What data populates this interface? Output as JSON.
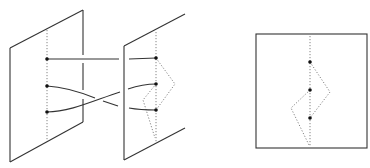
{
  "figure": {
    "colors": {
      "line": "#333333",
      "dotted": "#777777",
      "point": "#111111",
      "background": "#ffffff"
    },
    "left_panel": {
      "plane_left": {
        "outline": [
          [
            10,
            48
          ],
          [
            83,
            10
          ],
          [
            83,
            122
          ],
          [
            10,
            162
          ]
        ],
        "axis": {
          "x": 47,
          "y1": 30,
          "y2": 140
        },
        "points": [
          [
            47,
            59
          ],
          [
            47,
            86
          ],
          [
            47,
            112
          ]
        ]
      },
      "plane_right": {
        "outline": [
          [
            124,
            46
          ],
          [
            185,
            14
          ],
          [
            185,
            128
          ],
          [
            124,
            160
          ]
        ],
        "axis": {
          "x": 156,
          "y1": 32,
          "y2": 142
        },
        "points": [
          [
            156,
            58
          ],
          [
            156,
            84
          ],
          [
            156,
            110
          ]
        ]
      },
      "strands_count": 3
    },
    "right_panel": {
      "square": {
        "x": 256,
        "y": 34,
        "w": 111,
        "h": 114
      },
      "axis": {
        "x": 310,
        "y1": 36,
        "y2": 146
      },
      "points": [
        [
          310,
          62
        ],
        [
          310,
          90
        ],
        [
          310,
          118
        ]
      ]
    }
  }
}
